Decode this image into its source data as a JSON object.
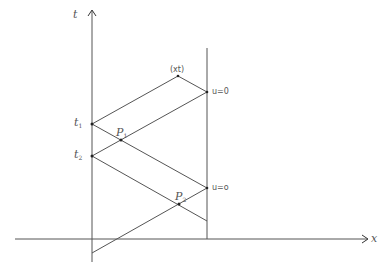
{
  "diagram": {
    "type": "characteristics-diagram",
    "axes": {
      "x_label": "x",
      "t_label": "t"
    },
    "labels": {
      "t1": "t",
      "t1_sub": "1",
      "t2": "t",
      "t2_sub": "2",
      "p1": "P",
      "p1_sub": "1",
      "p2": "P",
      "p2_sub": "2",
      "xt_point": "(xt)",
      "u_upper": "u=0",
      "u_lower": "u=o"
    },
    "colors": {
      "line": "#555555",
      "point": "#222222",
      "text": "#555555"
    },
    "points": {
      "t1": [
        92,
        124
      ],
      "t2": [
        92,
        156
      ],
      "xt": [
        178,
        76
      ],
      "u_upper": [
        207,
        92
      ],
      "u_lower": [
        207,
        188
      ],
      "P1": [
        121,
        140
      ],
      "P2": [
        179,
        204
      ]
    }
  }
}
